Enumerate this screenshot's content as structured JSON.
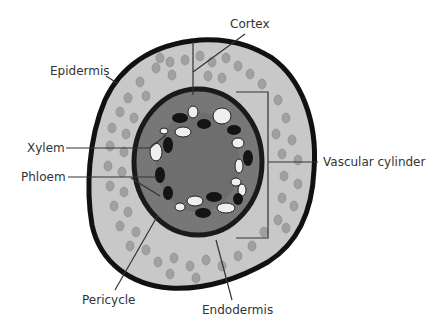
{
  "diagram": {
    "labels": {
      "cortex": "Cortex",
      "epidermis": "Epidermis",
      "xylem": "Xylem",
      "phloem": "Phloem",
      "vascular_cylinder": "Vascular cylinder",
      "pericycle": "Pericycle",
      "endodermis": "Endodermis"
    },
    "colors": {
      "epidermis_outline": "#111111",
      "cortex_fill": "#c8c8c8",
      "cortex_cells": "#9a9a9a",
      "vascular_fill": "#777777",
      "endodermis_ring": "#1a1a1a",
      "xylem_cells": "#efefef",
      "phloem_cells": "#141414",
      "leader_lines": "#333333"
    }
  }
}
